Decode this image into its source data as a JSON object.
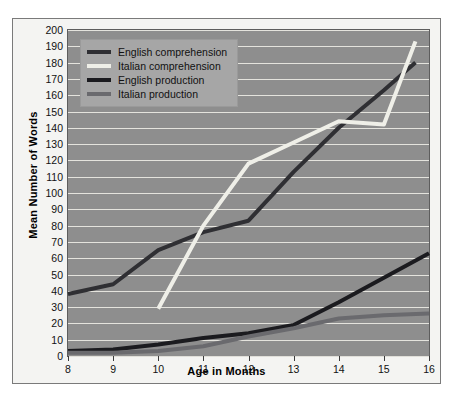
{
  "chart_data": {
    "type": "line",
    "title": "",
    "xlabel": "Age in Months",
    "ylabel": "Mean Number of Words",
    "xlim": [
      8,
      16
    ],
    "ylim": [
      0,
      200
    ],
    "xticks": [
      8,
      9,
      10,
      11,
      12,
      13,
      14,
      15,
      16
    ],
    "yticks": [
      0,
      10,
      20,
      30,
      40,
      50,
      60,
      70,
      80,
      90,
      100,
      110,
      120,
      130,
      140,
      150,
      160,
      170,
      180,
      190,
      200
    ],
    "grid": true,
    "legend_position": "top-left",
    "plot_background": "#8e8e8e",
    "gridline_color": "#eceae4",
    "series": [
      {
        "name": "English comprehension",
        "color": "#2f2f33",
        "x": [
          8,
          9,
          10,
          11,
          12,
          13,
          14,
          15,
          15.7
        ],
        "values": [
          38,
          44,
          65,
          76,
          83,
          113,
          140,
          163,
          180
        ]
      },
      {
        "name": "Italian comprehension",
        "color": "#efefe8",
        "x": [
          10,
          11,
          12,
          13,
          14,
          15,
          15.7
        ],
        "values": [
          29,
          80,
          118,
          131,
          144,
          142,
          193
        ]
      },
      {
        "name": "English production",
        "color": "#1b1b1f",
        "x": [
          8,
          9,
          10,
          11,
          12,
          13,
          14,
          15,
          16
        ],
        "values": [
          3,
          4,
          7,
          11,
          14,
          19,
          33,
          48,
          63
        ]
      },
      {
        "name": "Italian production",
        "color": "#6a6a6e",
        "x": [
          8,
          9,
          10,
          11,
          12,
          13,
          14,
          15,
          16
        ],
        "values": [
          2,
          2,
          3,
          6,
          12,
          17,
          23,
          25,
          26
        ]
      }
    ]
  },
  "legend": {
    "items": [
      {
        "label": "English comprehension",
        "color": "#2f2f33"
      },
      {
        "label": "Italian comprehension",
        "color": "#efefe8"
      },
      {
        "label": "English production",
        "color": "#1b1b1f"
      },
      {
        "label": "Italian production",
        "color": "#6a6a6e"
      }
    ]
  },
  "axes": {
    "y_title": "Mean Number of Words",
    "x_title": "Age in Months"
  }
}
